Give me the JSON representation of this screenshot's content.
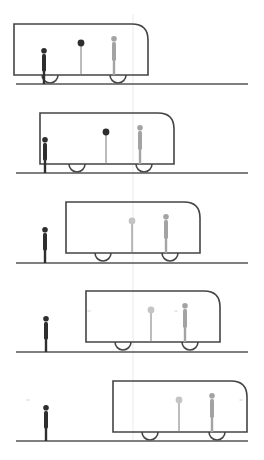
{
  "diagram": {
    "title": "Moving train relative to stationary observer (five frames)",
    "colors": {
      "background": "#ffffff",
      "train_outline": "#444444",
      "ground": "#555555",
      "observer": "#2e2e2e",
      "post_stem": "#7a7a7a",
      "passenger": "#a3a3a3",
      "reference_line": "#e4e4e4",
      "faint_mark": "#cfcfcf"
    },
    "train": {
      "width": 134,
      "height": 51,
      "corner_radius": 16,
      "wheel_radius": 8
    },
    "ground": {
      "x1": 16,
      "x2": 248
    },
    "reference_line_x": 133,
    "frames": [
      {
        "index": 1,
        "train_x": 14,
        "train_y": 24,
        "ground_y": 84,
        "observer_x": 44,
        "post_x": 81,
        "post_ball_color": "#2e2e2e",
        "passenger_x": 114,
        "wheels_x": [
          50,
          118
        ],
        "marks": []
      },
      {
        "index": 2,
        "train_x": 40,
        "train_y": 113,
        "ground_y": 173,
        "observer_x": 45,
        "post_x": 106,
        "post_ball_color": "#2e2e2e",
        "passenger_x": 140,
        "wheels_x": [
          77,
          144
        ],
        "marks": []
      },
      {
        "index": 3,
        "train_x": 66,
        "train_y": 202,
        "ground_y": 263,
        "observer_x": 45,
        "post_x": 132,
        "post_ball_color": "#c4c4c4",
        "passenger_x": 166,
        "wheels_x": [
          103,
          170
        ],
        "marks": []
      },
      {
        "index": 4,
        "train_x": 86,
        "train_y": 291,
        "ground_y": 352,
        "observer_x": 46,
        "post_x": 151,
        "post_ball_color": "#c4c4c4",
        "passenger_x": 185,
        "wheels_x": [
          123,
          190
        ],
        "marks": [
          [
            89,
            311
          ],
          [
            176,
            311
          ]
        ]
      },
      {
        "index": 5,
        "train_x": 113,
        "train_y": 381,
        "ground_y": 441,
        "observer_x": 46,
        "post_x": 179,
        "post_ball_color": "#c4c4c4",
        "passenger_x": 212,
        "wheels_x": [
          150,
          217
        ],
        "marks": [
          [
            28,
            400
          ],
          [
            241,
            400
          ]
        ]
      }
    ]
  }
}
